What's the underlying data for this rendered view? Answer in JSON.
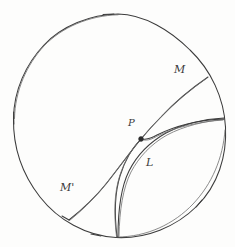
{
  "figure": {
    "background_color": "#fdfdfc",
    "stroke_color": "#3c3c3c",
    "point_color": "#2b2b2b",
    "width": 235,
    "height": 247,
    "boundary": {
      "name": "disk-boundary-circle",
      "center_x": 119,
      "center_y": 125,
      "radius": 106
    },
    "points": [
      {
        "id": "P",
        "label": "P",
        "x": 141,
        "y": 139,
        "label_x": 128,
        "label_y": 118,
        "description": "intersection point of geodesic M-M' and curve L"
      }
    ],
    "labels": [
      {
        "id": "M",
        "text": "M",
        "x": 174,
        "y": 64,
        "description": "upper right endpoint label of geodesic"
      },
      {
        "id": "Mprime",
        "text": "M'",
        "x": 60,
        "y": 182,
        "description": "lower left endpoint label of geodesic"
      },
      {
        "id": "L",
        "text": "L",
        "x": 146,
        "y": 157,
        "description": "label for the curve L"
      }
    ],
    "curves": [
      {
        "id": "geodesic-mm-prime",
        "label": "M M'",
        "from": "M",
        "to": "M'",
        "start_x": 208,
        "start_y": 77,
        "end_x": 69,
        "end_y": 220,
        "passes_through": "P"
      },
      {
        "id": "curve-l-outer",
        "label": "L",
        "start_x": 224,
        "start_y": 118,
        "end_x": 118,
        "end_y": 237
      },
      {
        "id": "curve-l-inner",
        "label": "L",
        "start_x": 224,
        "start_y": 119,
        "end_x": 117,
        "end_y": 237
      }
    ]
  }
}
